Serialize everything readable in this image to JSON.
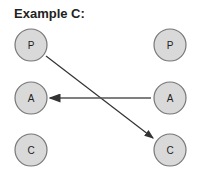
{
  "title": "Example C:",
  "left_nodes": [
    {
      "label": "P"
    },
    {
      "label": "A"
    },
    {
      "label": "C"
    }
  ],
  "right_nodes": [
    {
      "label": "P"
    },
    {
      "label": "A"
    },
    {
      "label": "C"
    }
  ],
  "edges": [
    {
      "from": "left.P",
      "to": "right.C"
    },
    {
      "from": "right.A",
      "to": "left.A"
    }
  ],
  "colors": {
    "node_fill": "#d9d9d9",
    "node_stroke": "#777777",
    "arrow": "#333333"
  }
}
